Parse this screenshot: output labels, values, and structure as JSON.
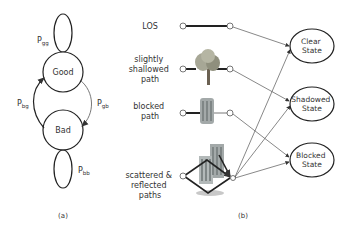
{
  "panel_a": {
    "caption": "(a)",
    "states": {
      "good": "Good",
      "bad": "Bad"
    },
    "transitions": {
      "gg": {
        "main": "P",
        "sub": "gg"
      },
      "bg": {
        "main": "P",
        "sub": "bg"
      },
      "gb": {
        "main": "P",
        "sub": "gb"
      },
      "bb": {
        "main": "P",
        "sub": "bb"
      }
    }
  },
  "panel_b": {
    "caption": "(b)",
    "paths": [
      {
        "lines": [
          "LOS"
        ],
        "icon": "none"
      },
      {
        "lines": [
          "slightly",
          "shallowed",
          "path"
        ],
        "icon": "tree"
      },
      {
        "lines": [
          "blocked",
          "path"
        ],
        "icon": "building"
      },
      {
        "lines": [
          "scattered &",
          "reflected",
          "paths"
        ],
        "icon": "buildings-reflection"
      }
    ],
    "states": [
      {
        "lines": [
          "Clear",
          "State"
        ]
      },
      {
        "lines": [
          "Shadowed",
          "State"
        ]
      },
      {
        "lines": [
          "Blocked",
          "State"
        ]
      }
    ]
  },
  "colors": {
    "line": "#222222",
    "thin": "#555555",
    "tree": "#8a8a7a",
    "building": "#9aa0a0"
  }
}
